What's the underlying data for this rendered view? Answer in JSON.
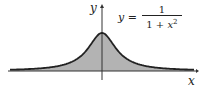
{
  "figure": {
    "equation": {
      "lhs": "y =",
      "numerator": "1",
      "denominator_prefix": "1 + ",
      "denominator_var": "x",
      "denominator_exp": "2"
    },
    "axes": {
      "x_label": "x",
      "y_label": "y"
    },
    "colors": {
      "fill": "#b3b3b3",
      "curve": "#222222",
      "axis": "#333333"
    }
  },
  "chart_data": {
    "type": "area",
    "xlabel": "x",
    "ylabel": "y",
    "function": "1/(1+x^2)",
    "x": [
      -4,
      -3,
      -2,
      -1,
      0,
      1,
      2,
      3,
      4
    ],
    "values": [
      0.059,
      0.1,
      0.2,
      0.5,
      1.0,
      0.5,
      0.2,
      0.1,
      0.059
    ],
    "shaded": "area between curve and x-axis",
    "grid": false
  }
}
